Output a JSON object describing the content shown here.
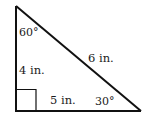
{
  "diagram": {
    "type": "right-triangle",
    "stroke_color": "#111111",
    "vertices": {
      "top": {
        "x": 16,
        "y": 6
      },
      "right_angle": {
        "x": 16,
        "y": 111
      },
      "bottom_right": {
        "x": 141,
        "y": 111
      }
    },
    "labels": {
      "top_angle": "60°",
      "vertical_side": "4 in.",
      "hypotenuse": "6 in.",
      "bottom_side": "5 in.",
      "bottom_right_angle": "30°"
    },
    "right_angle_marker": true
  }
}
